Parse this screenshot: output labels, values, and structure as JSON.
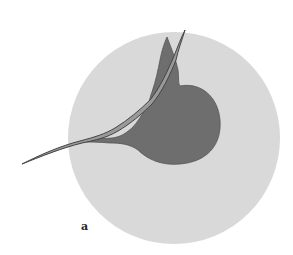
{
  "figure": {
    "panel_label": "a",
    "colors": {
      "background": "#ffffff",
      "outer_circle": "#d9d9d9",
      "cell_body": "#6e6e6e",
      "cell_outline": "#555555",
      "fiber_fill": "#9a9a9a",
      "fiber_outline": "#444444"
    }
  }
}
